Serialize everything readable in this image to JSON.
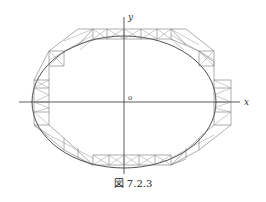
{
  "figure": {
    "caption": "図 7.2.3",
    "axes": {
      "x_label": "x",
      "y_label": "y",
      "origin_label": "o"
    },
    "colors": {
      "lines": "#6a6a6a",
      "curve": "#222222",
      "axes": "#333333",
      "background": "#ffffff"
    }
  }
}
